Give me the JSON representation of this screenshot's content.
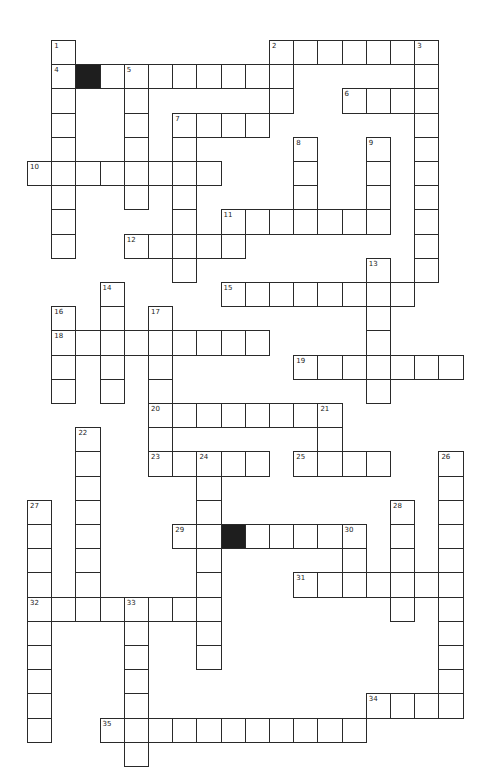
{
  "puzzle": {
    "type": "crossword",
    "origin": {
      "x": 27,
      "y": 40
    },
    "cell_size": 24.2,
    "colors": {
      "line": "#2a2a2a",
      "block": "#1e1e1e",
      "background": "#ffffff"
    },
    "black_cells": [
      [
        2,
        1
      ],
      [
        8,
        20
      ]
    ],
    "entries": [
      {
        "num": "1",
        "dir": "down",
        "col": 1,
        "row": 0,
        "len": 9
      },
      {
        "num": "2",
        "dir": "across",
        "col": 10,
        "row": 0,
        "len": 7
      },
      {
        "num": "2d",
        "dir": "down",
        "col": 10,
        "row": 0,
        "len": 3,
        "label": false
      },
      {
        "num": "3",
        "dir": "down",
        "col": 16,
        "row": 0,
        "len": 10
      },
      {
        "num": "4",
        "dir": "across",
        "col": 1,
        "row": 1,
        "len": 10
      },
      {
        "num": "5",
        "dir": "down",
        "col": 4,
        "row": 1,
        "len": 6
      },
      {
        "num": "6",
        "dir": "across",
        "col": 13,
        "row": 2,
        "len": 4
      },
      {
        "num": "7",
        "dir": "across",
        "col": 6,
        "row": 3,
        "len": 4
      },
      {
        "num": "7d",
        "dir": "down",
        "col": 6,
        "row": 3,
        "len": 7,
        "label": false
      },
      {
        "num": "8",
        "dir": "down",
        "col": 11,
        "row": 4,
        "len": 4
      },
      {
        "num": "9",
        "dir": "down",
        "col": 14,
        "row": 4,
        "len": 4
      },
      {
        "num": "10",
        "dir": "across",
        "col": 0,
        "row": 5,
        "len": 8
      },
      {
        "num": "11",
        "dir": "across",
        "col": 8,
        "row": 7,
        "len": 7
      },
      {
        "num": "11d",
        "dir": "down",
        "col": 8,
        "row": 7,
        "len": 2,
        "label": false
      },
      {
        "num": "12",
        "dir": "across",
        "col": 4,
        "row": 8,
        "len": 5
      },
      {
        "num": "13",
        "dir": "down",
        "col": 14,
        "row": 9,
        "len": 6
      },
      {
        "num": "14",
        "dir": "down",
        "col": 3,
        "row": 10,
        "len": 5
      },
      {
        "num": "15",
        "dir": "across",
        "col": 8,
        "row": 10,
        "len": 8
      },
      {
        "num": "16",
        "dir": "down",
        "col": 1,
        "row": 11,
        "len": 4
      },
      {
        "num": "17",
        "dir": "down",
        "col": 5,
        "row": 11,
        "len": 7
      },
      {
        "num": "18",
        "dir": "across",
        "col": 1,
        "row": 12,
        "len": 9
      },
      {
        "num": "19",
        "dir": "across",
        "col": 11,
        "row": 13,
        "len": 7
      },
      {
        "num": "20",
        "dir": "across",
        "col": 5,
        "row": 15,
        "len": 8
      },
      {
        "num": "21",
        "dir": "down",
        "col": 12,
        "row": 15,
        "len": 3
      },
      {
        "num": "22",
        "dir": "down",
        "col": 2,
        "row": 16,
        "len": 8
      },
      {
        "num": "23",
        "dir": "across",
        "col": 5,
        "row": 17,
        "len": 5
      },
      {
        "num": "24",
        "dir": "down",
        "col": 7,
        "row": 17,
        "len": 9
      },
      {
        "num": "25",
        "dir": "across",
        "col": 11,
        "row": 17,
        "len": 4
      },
      {
        "num": "26",
        "dir": "down",
        "col": 17,
        "row": 17,
        "len": 11
      },
      {
        "num": "27",
        "dir": "down",
        "col": 0,
        "row": 19,
        "len": 10
      },
      {
        "num": "28",
        "dir": "down",
        "col": 15,
        "row": 19,
        "len": 5
      },
      {
        "num": "29",
        "dir": "across",
        "col": 6,
        "row": 20,
        "len": 8
      },
      {
        "num": "30",
        "dir": "down",
        "col": 13,
        "row": 20,
        "len": 3
      },
      {
        "num": "31",
        "dir": "across",
        "col": 11,
        "row": 22,
        "len": 7
      },
      {
        "num": "32",
        "dir": "across",
        "col": 0,
        "row": 23,
        "len": 8
      },
      {
        "num": "33",
        "dir": "down",
        "col": 4,
        "row": 23,
        "len": 7
      },
      {
        "num": "34",
        "dir": "across",
        "col": 14,
        "row": 27,
        "len": 4
      },
      {
        "num": "35",
        "dir": "across",
        "col": 3,
        "row": 28,
        "len": 11
      }
    ]
  }
}
